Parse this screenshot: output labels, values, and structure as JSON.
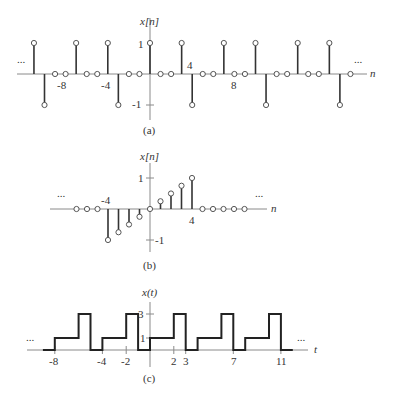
{
  "chart_data": [
    {
      "panel": "(a)",
      "type": "stem",
      "ylabel": "x[n]",
      "xlabel": "n",
      "x_tick_labels": [
        "-8",
        "-4",
        "4",
        "8"
      ],
      "y_tick_labels": [
        "1",
        "-1"
      ],
      "ellipsis_left": "...",
      "ellipsis_right": "...",
      "period": 7,
      "one_period": {
        "n": [
          0,
          1,
          2,
          3,
          4,
          5,
          6
        ],
        "values": [
          1,
          0,
          0,
          1,
          -1,
          0,
          0
        ]
      },
      "n": [
        -11,
        -10,
        -9,
        -8,
        -7,
        -6,
        -5,
        -4,
        -3,
        -2,
        -1,
        0,
        1,
        2,
        3,
        4,
        5,
        6,
        7,
        8,
        9,
        10,
        11,
        12,
        13,
        14,
        15,
        16,
        17,
        18,
        19
      ],
      "values": [
        1,
        -1,
        0,
        0,
        1,
        0,
        0,
        1,
        -1,
        0,
        0,
        1,
        0,
        0,
        1,
        -1,
        0,
        0,
        1,
        0,
        0,
        1,
        -1,
        0,
        0,
        1,
        0,
        0,
        1,
        -1,
        0
      ],
      "caption": "(a)"
    },
    {
      "panel": "(b)",
      "type": "stem",
      "ylabel": "x[n]",
      "xlabel": "n",
      "x_tick_labels": [
        "-4",
        "4"
      ],
      "y_tick_labels": [
        "1",
        "-1"
      ],
      "ellipsis_left": "...",
      "ellipsis_right": "...",
      "n": [
        -7,
        -6,
        -5,
        -4,
        -3,
        -2,
        -1,
        0,
        1,
        2,
        3,
        4,
        5,
        6,
        7,
        8,
        9
      ],
      "values": [
        0,
        0,
        0,
        -1,
        -0.75,
        -0.5,
        -0.25,
        0,
        0.25,
        0.5,
        0.75,
        1,
        0,
        0,
        0,
        0,
        0
      ],
      "caption": "(b)"
    },
    {
      "panel": "(c)",
      "type": "line",
      "ylabel": "x(t)",
      "xlabel": "t",
      "x_tick_labels": [
        "-8",
        "-4",
        "-2",
        "2",
        "3",
        "7",
        "11"
      ],
      "y_tick_labels": [
        "3",
        "1"
      ],
      "ellipsis_left": "...",
      "ellipsis_right": "...",
      "period": 4,
      "one_period": {
        "segments": [
          {
            "t0": 0,
            "t1": 2,
            "value": 1
          },
          {
            "t0": 2,
            "t1": 3,
            "value": 3
          },
          {
            "t0": 3,
            "t1": 4,
            "value": 0
          }
        ]
      },
      "t_range": [
        -9,
        12
      ],
      "caption": "(c)"
    }
  ]
}
